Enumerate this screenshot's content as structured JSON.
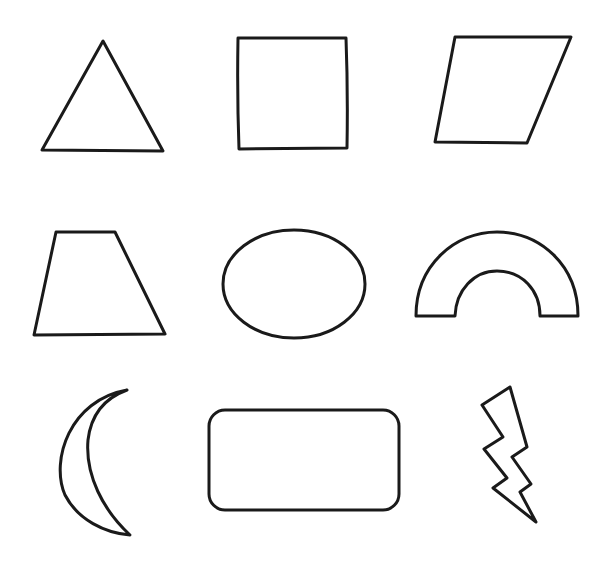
{
  "stroke_color": "#1a1a1a",
  "background_color": "#ffffff",
  "grid": {
    "rows": 3,
    "columns": 3
  },
  "shapes": [
    {
      "name": "triangle",
      "row": 1,
      "column": 1
    },
    {
      "name": "square",
      "row": 1,
      "column": 2
    },
    {
      "name": "parallelogram",
      "row": 1,
      "column": 3
    },
    {
      "name": "trapezoid",
      "row": 2,
      "column": 1
    },
    {
      "name": "oval",
      "row": 2,
      "column": 2
    },
    {
      "name": "arch",
      "row": 2,
      "column": 3
    },
    {
      "name": "crescent",
      "row": 3,
      "column": 1
    },
    {
      "name": "rounded-rectangle",
      "row": 3,
      "column": 2
    },
    {
      "name": "lightning-bolt",
      "row": 3,
      "column": 3
    }
  ]
}
